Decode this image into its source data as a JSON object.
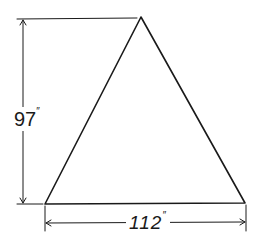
{
  "diagram": {
    "type": "dimensioned-triangle",
    "shape": "isosceles-triangle",
    "stroke_color": "#1a1a1a",
    "background_color": "#ffffff",
    "dimensions": {
      "height": {
        "value": "97",
        "unit": "″"
      },
      "base": {
        "value": "112",
        "unit": "″"
      }
    },
    "vertices": {
      "apex": [
        141,
        17
      ],
      "bottom_left": [
        45,
        204
      ],
      "bottom_right": [
        245,
        203
      ]
    }
  }
}
